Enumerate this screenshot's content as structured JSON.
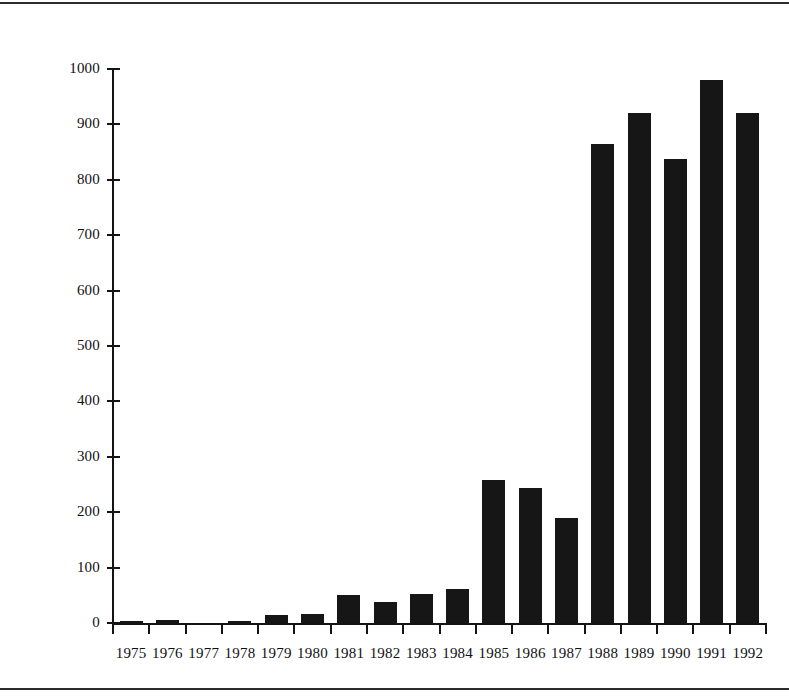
{
  "chart_data": {
    "type": "bar",
    "title": "",
    "subtitle": "",
    "xlabel": "",
    "ylabel": "",
    "categories": [
      "1975",
      "1976",
      "1977",
      "1978",
      "1979",
      "1980",
      "1981",
      "1982",
      "1983",
      "1984",
      "1985",
      "1986",
      "1987",
      "1988",
      "1989",
      "1990",
      "1991",
      "1992"
    ],
    "values": [
      3,
      6,
      0,
      3,
      14,
      17,
      50,
      38,
      52,
      62,
      258,
      243,
      190,
      865,
      920,
      837,
      980,
      920
    ],
    "ylim": [
      0,
      1000
    ],
    "ytick_labels": [
      "0",
      "100",
      "200",
      "300",
      "400",
      "500",
      "600",
      "700",
      "800",
      "900",
      "1000"
    ],
    "ytick_values": [
      0,
      100,
      200,
      300,
      400,
      500,
      600,
      700,
      800,
      900,
      1000
    ],
    "grid": false,
    "legend": false,
    "legend_position": "none",
    "bar_color": "#161616",
    "axis_color": "#141414",
    "background_color": "#ffffff"
  },
  "figure": {
    "rule_color": "#2b2b2b"
  }
}
